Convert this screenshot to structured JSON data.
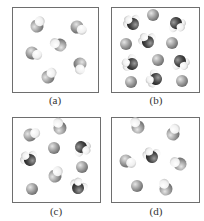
{
  "figure": {
    "panels": [
      {
        "id": "a",
        "label": "(a)",
        "description": "6 identical diatomic molecules (gray atom + white atom)",
        "molecules": [
          {
            "type": "diatomic-light"
          },
          {
            "type": "diatomic-light"
          },
          {
            "type": "diatomic-light"
          },
          {
            "type": "diatomic-light"
          },
          {
            "type": "diatomic-light"
          },
          {
            "type": "diatomic-light"
          }
        ]
      },
      {
        "id": "b",
        "label": "(b)",
        "description": "6 single gray atoms and 6 dark polyatomic molecules with white atoms",
        "molecules": [
          {
            "type": "polyatomic-dark"
          },
          {
            "type": "atom-gray"
          },
          {
            "type": "polyatomic-dark"
          },
          {
            "type": "atom-gray"
          },
          {
            "type": "polyatomic-dark"
          },
          {
            "type": "atom-gray"
          },
          {
            "type": "polyatomic-dark"
          },
          {
            "type": "atom-gray"
          },
          {
            "type": "polyatomic-dark"
          },
          {
            "type": "atom-gray"
          },
          {
            "type": "polyatomic-dark"
          },
          {
            "type": "atom-gray"
          }
        ]
      },
      {
        "id": "c",
        "label": "(c)",
        "description": "Mixture of diatomic molecules, single atoms and dark polyatomic molecules",
        "molecules": [
          {
            "type": "diatomic-light"
          },
          {
            "type": "diatomic-light"
          },
          {
            "type": "atom-gray"
          },
          {
            "type": "polyatomic-dark"
          },
          {
            "type": "polyatomic-dark"
          },
          {
            "type": "atom-gray"
          },
          {
            "type": "diatomic-light"
          },
          {
            "type": "atom-gray"
          },
          {
            "type": "polyatomic-dark"
          }
        ]
      },
      {
        "id": "d",
        "label": "(d)",
        "description": "Mostly diatomic molecules, one dark polyatomic molecule and one single atom",
        "molecules": [
          {
            "type": "diatomic-light"
          },
          {
            "type": "diatomic-light"
          },
          {
            "type": "polyatomic-dark"
          },
          {
            "type": "diatomic-light"
          },
          {
            "type": "diatomic-light"
          },
          {
            "type": "atom-gray"
          },
          {
            "type": "diatomic-light"
          }
        ]
      }
    ],
    "colors": {
      "atom_gray": "#9a9a9a",
      "atom_dark": "#4a4a4a",
      "atom_white": "#f4f4f4",
      "border": "#6e6e6e"
    }
  }
}
